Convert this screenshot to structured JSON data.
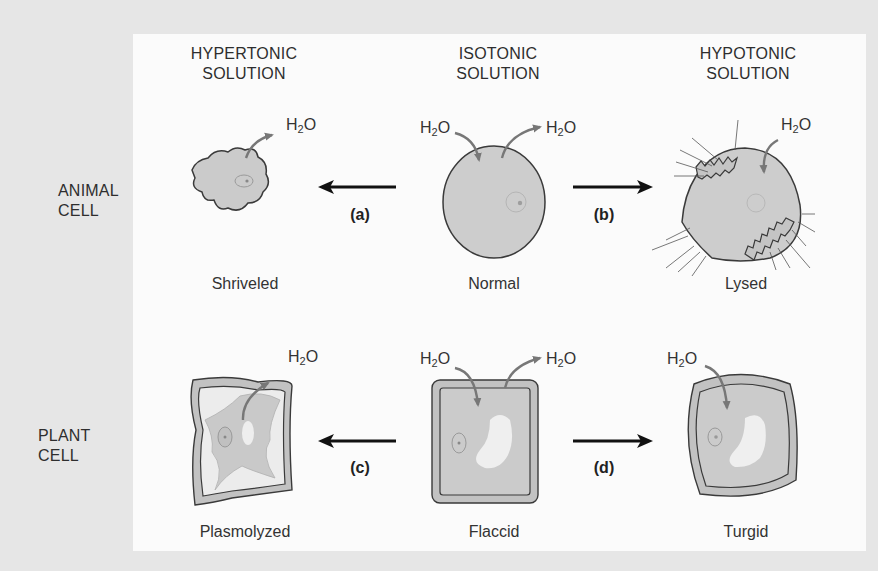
{
  "columns": [
    {
      "id": "hypertonic",
      "header_line1": "HYPERTONIC",
      "header_line2": "SOLUTION"
    },
    {
      "id": "isotonic",
      "header_line1": "ISOTONIC",
      "header_line2": "SOLUTION"
    },
    {
      "id": "hypotonic",
      "header_line1": "HYPOTONIC",
      "header_line2": "SOLUTION"
    }
  ],
  "rows": [
    {
      "id": "animal",
      "label_line1": "ANIMAL",
      "label_line2": "CELL"
    },
    {
      "id": "plant",
      "label_line1": "PLANT",
      "label_line2": "CELL"
    }
  ],
  "cells": {
    "animal_hypertonic": {
      "caption": "Shriveled"
    },
    "animal_isotonic": {
      "caption": "Normal"
    },
    "animal_hypotonic": {
      "caption": "Lysed"
    },
    "plant_hypertonic": {
      "caption": "Plasmolyzed"
    },
    "plant_isotonic": {
      "caption": "Flaccid"
    },
    "plant_hypotonic": {
      "caption": "Turgid"
    }
  },
  "arrows": [
    {
      "label": "(a)",
      "direction": "left",
      "row": "animal"
    },
    {
      "label": "(b)",
      "direction": "right",
      "row": "animal"
    },
    {
      "label": "(c)",
      "direction": "left",
      "row": "plant"
    },
    {
      "label": "(d)",
      "direction": "right",
      "row": "plant"
    }
  ],
  "water": {
    "base": "H",
    "subscript": "2",
    "tail": "O"
  },
  "colors": {
    "background": "#e6e6e6",
    "panel": "#fbfbfb",
    "cytoplasm": "#c9c9c9",
    "cell_wall": "#bdbdbd",
    "vacuole": "#f0f0f0",
    "outline": "#3a3a3a",
    "water_arrow": "#777777",
    "process_arrow": "#111111"
  }
}
